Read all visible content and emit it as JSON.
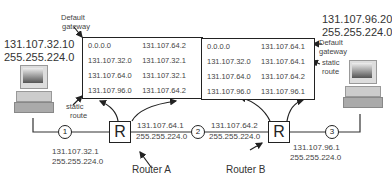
{
  "hosts": {
    "left": {
      "ip": "131.107.32.10",
      "mask": "255.255.224.0"
    },
    "right": {
      "ip": "131.107.96.20",
      "mask": "255.255.224.0"
    }
  },
  "routers": {
    "a": {
      "symbol": "R",
      "label": "Router A",
      "left_if": {
        "ip": "131.107.32.1",
        "mask": "255.255.224.0"
      },
      "right_if": {
        "ip": "131.107.64.1",
        "mask": "255.255.224.0"
      },
      "table": [
        {
          "network": "0.0.0.0",
          "gateway": "131.107.64.2"
        },
        {
          "network": "131.107.32.0",
          "gateway": "131.107.32.1"
        },
        {
          "network": "131.107.64.0",
          "gateway": "131.107.32.1"
        },
        {
          "network": "131.107.96.0",
          "gateway": "131.107.64.2"
        }
      ],
      "annotations": {
        "default_gateway": [
          "Default",
          "gateway"
        ],
        "static_route": [
          "static",
          "route"
        ]
      }
    },
    "b": {
      "symbol": "R",
      "label": "Router B",
      "left_if": {
        "ip": "131.107.64.2",
        "mask": "255.255.224.0"
      },
      "right_if": {
        "ip": "131.107.96.1",
        "mask": "255.255.224.0"
      },
      "table": [
        {
          "network": "0.0.0.0",
          "gateway": "131.107.64.1"
        },
        {
          "network": "131.107.32.0",
          "gateway": "131.107.64.1"
        },
        {
          "network": "131.107.64.0",
          "gateway": "131.107.64.2"
        },
        {
          "network": "131.107.96.0",
          "gateway": "131.107.96.1"
        }
      ],
      "annotations": {
        "default_gateway": [
          "Default",
          "gateway"
        ],
        "static_route": [
          "static",
          "route"
        ]
      }
    }
  },
  "segments": [
    "1",
    "2",
    "3"
  ]
}
